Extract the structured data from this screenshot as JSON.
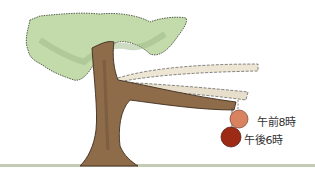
{
  "illustration": {
    "subject": "tree with branch drooping over the day",
    "labels": {
      "morning": "午前8時",
      "evening": "午後6時"
    },
    "colors": {
      "foliage": "#b9d3a0",
      "foliage_dark": "#8fb07a",
      "trunk": "#8a6a4a",
      "trunk_dark": "#5c4330",
      "ghost_branch": "#ece4d2",
      "fruit_morning": "#d9825f",
      "fruit_evening": "#9c2a14",
      "ground": "#b8c0a8"
    }
  }
}
